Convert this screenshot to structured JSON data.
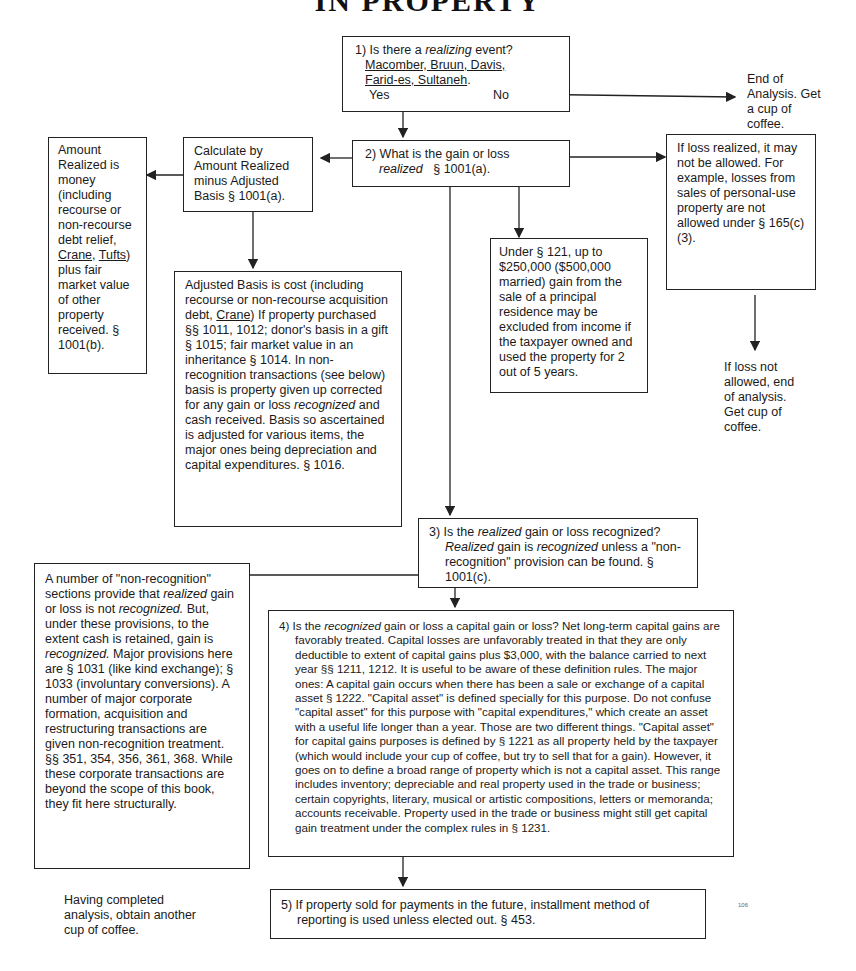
{
  "title": "IN PROPERTY",
  "page_number": "106",
  "nodes": {
    "q1": {
      "label": "1) Is there a",
      "emph": "realizing",
      "label_end": "event?",
      "cases_line1": "Macomber, Bruun, Davis,",
      "cases_line2": "Farid-es, Sultaneh",
      "cases_end": ".",
      "yes": "Yes",
      "no": "No"
    },
    "end1": {
      "text": "End of Analysis. Get a cup of coffee."
    },
    "q2": {
      "label": "2) What is the gain or loss",
      "emph": "realized",
      "ref": "§ 1001(a)."
    },
    "calc": {
      "text": "Calculate by Amount Realized minus Adjusted Basis § 1001(a)."
    },
    "amount_realized": {
      "pre": "Amount Realized is money (including recourse or non-recourse debt relief,",
      "case1": "Crane",
      "sep": ",",
      "case2": "Tufts",
      "post": ") plus fair market value of other property received. § 1001(b)."
    },
    "adjusted_basis": {
      "pre": "Adjusted Basis is cost (including recourse or non-recourse acquisition debt,",
      "case": "Crane",
      "mid": ")  If property purchased §§ 1011, 1012; donor's basis in a gift § 1015; fair market value in an inheritance § 1014.  In non-recognition transactions (see below) basis is property given up corrected for any gain or loss",
      "emph": "recognized",
      "post": "and cash received. Basis so ascertained is adjusted for various items, the major ones being depreciation and capital expenditures.  § 1016."
    },
    "sec121": {
      "text": "Under § 121, up to $250,000 ($500,000 married) gain from the sale of a principal residence may be excluded from income if the taxpayer owned and used the property for 2 out of 5 years."
    },
    "loss": {
      "text": "If loss realized, it may not be allowed. For example, losses from sales of personal-use property are not allowed under § 165(c)(3)."
    },
    "end2": {
      "text": "If loss not allowed, end of analysis. Get cup of coffee."
    },
    "q3": {
      "a": "3) Is the",
      "b": "realized",
      "c": "gain or loss recognized?",
      "d": "Realized",
      "e": "gain is",
      "f": "recognized",
      "g": "unless a \"non-recognition\" provision can be found. § 1001(c)."
    },
    "nonrec": {
      "a": "A number of \"non-recognition\" sections provide that",
      "b": "realized",
      "c": "gain or loss is not",
      "d": "recognized.",
      "e": "But, under these provisions, to the extent cash is retained, gain is",
      "f": "recognized.",
      "g": " Major provisions here are § 1031 (like kind exchange); § 1033 (involuntary conversions).  A number of major corporate formation, acquisition and restructuring transactions are given non-recognition treatment. §§ 351, 354, 356, 361, 368.  While these corporate transactions are beyond the scope of this book, they fit here structurally."
    },
    "q4": {
      "a": "4) Is the",
      "b": "recognized",
      "c": "gain or loss a capital gain or loss?  Net long-term capital gains are favorably treated.  Capital losses are unfavorably treated in that they are only deductible to extent of capital gains plus $3,000, with the balance carried to next year  §§ 1211, 1212.  It is useful to be aware of these definition rules.  The major ones: A capital gain occurs when there has been a sale or exchange of a capital asset  § 1222.  \"Capital asset\" is defined specially for this purpose.  Do not confuse \"capital asset\" for this purpose with \"capital expenditures,\" which create an asset with a useful life longer than a year.  Those are two different things.  \"Capital asset\" for capital gains purposes is defined by § 1221 as all property held by the taxpayer (which would include your cup of coffee, but try to sell that for a gain).  However, it goes on to define a broad range of property which is not a capital asset.  This range includes inventory; depreciable and real property used in the trade or business; certain copyrights, literary, musical or artistic compositions, letters or memoranda; accounts receivable.  Property used in the trade or business might still get capital gain treatment under the complex rules in § 1231."
    },
    "q5": {
      "text": "5) If property sold for payments in the future, installment method of reporting is used unless elected out. § 453."
    },
    "end3": {
      "text": "Having completed analysis, obtain another cup of coffee."
    }
  },
  "colors": {
    "ink": "#1a1a1a",
    "paper": "#ffffff"
  }
}
